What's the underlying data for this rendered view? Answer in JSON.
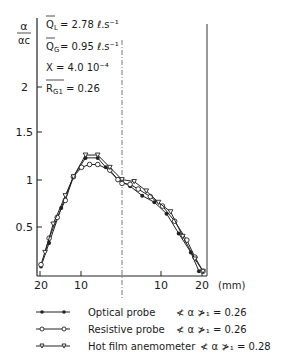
{
  "chart_data": {
    "type": "line",
    "title": "",
    "ylabel": "α/αc",
    "xlabel": "(mm)",
    "ylim": [
      0,
      2.3
    ],
    "xlim": [
      -20,
      20
    ],
    "y_ticks": [
      "0.5",
      "1",
      "1.5",
      "2"
    ],
    "x_ticks": [
      "20",
      "10",
      "10",
      "20"
    ],
    "x_unit": "(mm)",
    "grid": false,
    "centerline": "dash-dot at x=0",
    "annotations": [
      {
        "label": "Q_L",
        "text": "Q̄L = 2.78 ℓ.s⁻¹"
      },
      {
        "label": "Q_G",
        "text": "Q̄G = 0.95 ℓ.s⁻¹"
      },
      {
        "label": "X",
        "text": "X = 4.0 10⁻⁴"
      },
      {
        "label": "R_G1",
        "text": "R̄G1 = 0.26"
      }
    ],
    "legend_position": "below",
    "series": [
      {
        "name": "Optical probe",
        "marker": "filled-circle",
        "mean_void": "0.26",
        "x": [
          -20,
          -18,
          -15,
          -12,
          -9,
          -6,
          -4,
          -1,
          0,
          2,
          5,
          8,
          11,
          14,
          17,
          19
        ],
        "y": [
          0.1,
          0.35,
          0.72,
          1.05,
          1.25,
          1.25,
          1.15,
          1.02,
          1.0,
          0.95,
          0.85,
          0.78,
          0.66,
          0.45,
          0.25,
          0.05
        ]
      },
      {
        "name": "Resistive probe",
        "marker": "open-circle",
        "mean_void": "0.26",
        "x": [
          -20,
          -18,
          -16,
          -14,
          -12,
          -10,
          -8,
          -6,
          -3,
          -1,
          0,
          2,
          4,
          7,
          10,
          13,
          16,
          18,
          20
        ],
        "y": [
          0.12,
          0.4,
          0.62,
          0.8,
          1.05,
          1.15,
          1.18,
          1.18,
          1.12,
          1.02,
          0.98,
          0.97,
          0.92,
          0.84,
          0.74,
          0.58,
          0.38,
          0.2,
          0.05
        ]
      },
      {
        "name": "Hot film anemometer",
        "marker": "open-triangle",
        "mean_void": "0.28",
        "x": [
          -19,
          -17,
          -14,
          -12,
          -9,
          -6,
          -3,
          0,
          3,
          6,
          9,
          12,
          15,
          18,
          20
        ],
        "y": [
          0.25,
          0.55,
          0.85,
          1.05,
          1.28,
          1.28,
          1.15,
          1.02,
          1.0,
          0.9,
          0.78,
          0.68,
          0.42,
          0.18,
          0.05
        ]
      }
    ]
  },
  "legend": {
    "items": [
      {
        "label": "Optical probe",
        "value": "≮ α ≯₁ = 0.26"
      },
      {
        "label": "Resistive probe",
        "value": "≮ α ≯₁ = 0.26"
      },
      {
        "label": "Hot film anemometer",
        "value": "≮ α ≯₁ = 0.28"
      }
    ]
  },
  "annotations": {
    "ql": "= 2.78 ℓ.s⁻¹",
    "qg": "= 0.95 ℓ.s⁻¹",
    "x": "X = 4.0 10⁻⁴",
    "rg": "= 0.26"
  },
  "axis": {
    "ylabel_num": "α",
    "ylabel_den": "αc",
    "y2": "2",
    "y15": "1.5",
    "y1": "1",
    "y05": "0.5",
    "x20l": "20",
    "x10l": "10",
    "x10r": "10",
    "x20r": "20",
    "unit": "(mm)"
  }
}
